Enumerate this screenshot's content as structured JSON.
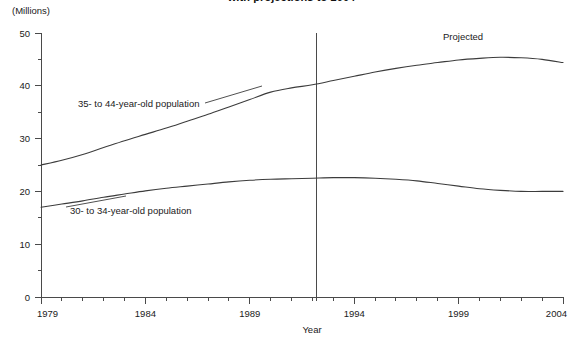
{
  "chart_data": {
    "type": "line",
    "title": "with projections to 2004",
    "xlabel": "Year",
    "ylabel": "(Millions)",
    "xlim": [
      1979,
      2004
    ],
    "ylim": [
      0,
      50
    ],
    "y_major_ticks": [
      0,
      10,
      20,
      30,
      40,
      50
    ],
    "y_minor_ticks": [
      5,
      15,
      25,
      35,
      45
    ],
    "y_tick_labels": [
      "0",
      "10",
      "20",
      "30",
      "40",
      "50"
    ],
    "x_tick_labels": [
      "1979",
      "1984",
      "1989",
      "1994",
      "1999",
      "2004"
    ],
    "x_labeled_ticks": [
      1979,
      1984,
      1989,
      1994,
      1999,
      2004
    ],
    "x_tick_interval": 1,
    "grid": false,
    "legend": "inline-labels",
    "x": [
      1979,
      1980,
      1981,
      1982,
      1983,
      1984,
      1985,
      1986,
      1987,
      1988,
      1989,
      1990,
      1991,
      1992,
      1993,
      1994,
      1995,
      1996,
      1997,
      1998,
      1999,
      2000,
      2001,
      2002,
      2003,
      2004
    ],
    "series": [
      {
        "name": "35- to 44-year-old population",
        "label": "35- to 44-year-old population",
        "values": [
          25.0,
          25.9,
          27.0,
          28.3,
          29.6,
          30.8,
          32.0,
          33.3,
          34.6,
          36.0,
          37.4,
          38.8,
          39.6,
          40.2,
          41.0,
          41.8,
          42.6,
          43.3,
          43.9,
          44.4,
          44.9,
          45.2,
          45.4,
          45.3,
          45.0,
          44.4
        ]
      },
      {
        "name": "30- to 34-year-old population",
        "label": "30- to 34-year-old population",
        "values": [
          17.0,
          17.6,
          18.2,
          18.9,
          19.5,
          20.1,
          20.6,
          21.0,
          21.4,
          21.8,
          22.1,
          22.3,
          22.4,
          22.5,
          22.6,
          22.6,
          22.5,
          22.3,
          22.0,
          21.5,
          21.0,
          20.5,
          20.2,
          20.0,
          20.0,
          20.0
        ]
      }
    ],
    "annotations": [
      {
        "text": "Projected",
        "x": 1999.2,
        "y": 48.0
      }
    ],
    "projection_divider": {
      "label": "projection-start",
      "x": 1992.2
    },
    "colors": {
      "line": "#3c3c3c",
      "axis": "#4a4a4a",
      "text": "#1a1a1a",
      "background": "#ffffff"
    }
  }
}
